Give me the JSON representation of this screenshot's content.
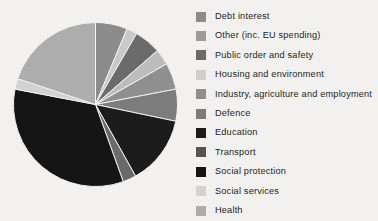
{
  "chart_data": {
    "type": "pie",
    "title": "",
    "legend_position": "right",
    "categories": [
      "Debt interest",
      "Other (inc. EU spending)",
      "Public order and safety",
      "Housing and environment",
      "Industry, agriculture and employment",
      "Defence",
      "Education",
      "Transport",
      "Social protection",
      "Social services",
      "Health"
    ],
    "values": [
      6.0,
      2.0,
      5.0,
      3.0,
      5.0,
      6.0,
      13.0,
      2.5,
      32.0,
      2.0,
      19.0
    ],
    "colors": [
      "#8c8c8c",
      "#c9c9c9",
      "#6b6b6b",
      "#bcbcbc",
      "#8f8f8f",
      "#7c7c7c",
      "#1c1c1c",
      "#6a6a6a",
      "#151515",
      "#d2d2d2",
      "#adadad"
    ],
    "start_angle_deg": 0,
    "direction": "clockwise",
    "grid": false
  },
  "legend": {
    "items": [
      {
        "label": "Debt interest",
        "color": "#8c8c8c"
      },
      {
        "label": "Other (inc. EU spending)",
        "color": "#9a9a9a"
      },
      {
        "label": "Public order and safety",
        "color": "#6b6b6b"
      },
      {
        "label": "Housing and environment",
        "color": "#cfcfcf"
      },
      {
        "label": "Industry, agriculture and employment",
        "color": "#8f8f8f"
      },
      {
        "label": "Defence",
        "color": "#7c7c7c"
      },
      {
        "label": "Education",
        "color": "#1c1c1c"
      },
      {
        "label": "Transport",
        "color": "#555555"
      },
      {
        "label": "Social protection",
        "color": "#151515"
      },
      {
        "label": "Social services",
        "color": "#d2d2d2"
      },
      {
        "label": "Health",
        "color": "#adadad"
      }
    ]
  },
  "theme": {
    "background": "#f2f1ef",
    "text_color": "#231f20",
    "slice_border": "#f2f1ef"
  }
}
